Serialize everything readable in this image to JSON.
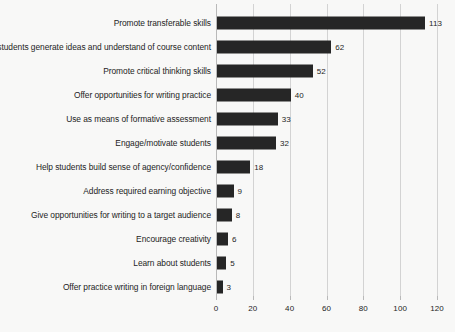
{
  "chart_data": {
    "type": "bar",
    "orientation": "horizontal",
    "title": "",
    "xlabel": "",
    "ylabel": "",
    "xlim": [
      0,
      120
    ],
    "xticks": [
      0,
      20,
      40,
      60,
      80,
      100,
      120
    ],
    "grid": true,
    "legend": false,
    "bar_color": "#262626",
    "background_color": "#f8f8f7",
    "gridline_color": "#d3d3d3",
    "show_value_labels": true,
    "categories": [
      "Promote transferable skills",
      "Help students generate ideas and understand of course content",
      "Promote critical thinking skills",
      "Offer opportunities for writing practice",
      "Use as means of formative assessment",
      "Engage/motivate students",
      "Help students build sense of agency/confidence",
      "Address required earning objective",
      "Give opportunities for writing to a target audience",
      "Encourage creativity",
      "Learn about students",
      "Offer practice writing in foreign language"
    ],
    "values": [
      113,
      62,
      52,
      40,
      33,
      32,
      18,
      9,
      8,
      6,
      5,
      3
    ]
  }
}
